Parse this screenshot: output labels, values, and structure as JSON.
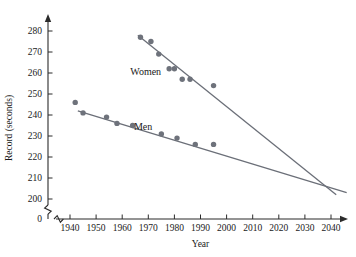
{
  "chart_data": {
    "type": "scatter",
    "title": "",
    "xlabel": "Year",
    "ylabel": "Record (seconds)",
    "xlim": [
      1933,
      2050
    ],
    "ylim": [
      196,
      286
    ],
    "grid": false,
    "legend_position": "inline-annotation",
    "y_axis_break": true,
    "y_break_label": "0",
    "xticks": [
      1940,
      1950,
      1960,
      1970,
      1980,
      1990,
      2000,
      2010,
      2020,
      2030,
      2040
    ],
    "xticklabels": [
      "1940",
      "1950",
      "1960",
      "1970",
      "1980",
      "1990",
      "2000",
      "2010",
      "2020",
      "2030",
      "2040"
    ],
    "yticks": [
      200,
      210,
      220,
      230,
      240,
      250,
      260,
      270,
      280
    ],
    "yticklabels": [
      "200",
      "210",
      "220",
      "230",
      "240",
      "250",
      "260",
      "270",
      "280"
    ],
    "series": [
      {
        "name": "Women",
        "label": "Women",
        "label_x": 1969,
        "label_y": 259,
        "marker_color": "#6e727b",
        "line_color": "#6b6f78",
        "points": [
          {
            "x": 1967,
            "y": 277
          },
          {
            "x": 1971,
            "y": 275
          },
          {
            "x": 1974,
            "y": 269
          },
          {
            "x": 1978,
            "y": 262
          },
          {
            "x": 1980,
            "y": 262
          },
          {
            "x": 1983,
            "y": 257
          },
          {
            "x": 1986,
            "y": 257
          },
          {
            "x": 1995,
            "y": 254
          }
        ],
        "trend_line": {
          "x1": 1966,
          "y1": 278,
          "x2": 2042,
          "y2": 202
        }
      },
      {
        "name": "Men",
        "label": "Men",
        "label_x": 1968,
        "label_y": 233,
        "marker_color": "#6e727b",
        "line_color": "#6b6f78",
        "points": [
          {
            "x": 1942,
            "y": 246
          },
          {
            "x": 1945,
            "y": 241
          },
          {
            "x": 1954,
            "y": 239
          },
          {
            "x": 1958,
            "y": 236
          },
          {
            "x": 1964,
            "y": 235
          },
          {
            "x": 1975,
            "y": 231
          },
          {
            "x": 1981,
            "y": 229
          },
          {
            "x": 1988,
            "y": 226
          },
          {
            "x": 1995,
            "y": 226
          }
        ],
        "trend_line": {
          "x1": 1943,
          "y1": 242,
          "x2": 2046,
          "y2": 203
        }
      }
    ]
  }
}
